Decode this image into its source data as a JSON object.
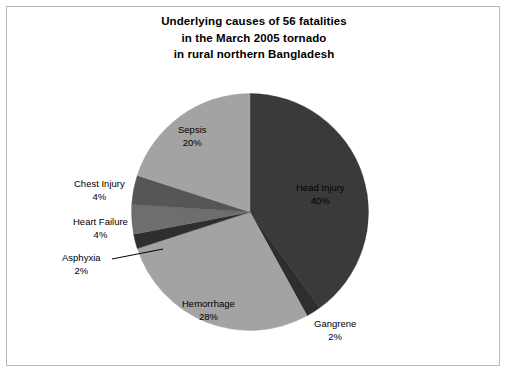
{
  "chart_data": {
    "type": "pie",
    "title": "Underlying causes of 56 fatalities in the March 2005 tornado in rural northern Bangladesh",
    "title_lines": [
      "Underlying causes of 56 fatalities",
      "in the March 2005 tornado",
      "in rural northern Bangladesh"
    ],
    "total_fatalities": 56,
    "legend": "none",
    "labels_inline": true,
    "start_angle_deg": 0,
    "direction": "clockwise",
    "categories": [
      "Head Injury",
      "Gangrene",
      "Hemorrhage",
      "Asphyxia",
      "Heart Failure",
      "Chest Injury",
      "Sepsis"
    ],
    "values": [
      40,
      2,
      28,
      2,
      4,
      4,
      20
    ],
    "value_unit": "percent",
    "slices": [
      {
        "name": "Head Injury",
        "percent": 40,
        "percent_text": "40%",
        "color": "#3a3a3a"
      },
      {
        "name": "Gangrene",
        "percent": 2,
        "percent_text": "2%",
        "color": "#2e2e2e"
      },
      {
        "name": "Hemorrhage",
        "percent": 28,
        "percent_text": "28%",
        "color": "#a3a3a3"
      },
      {
        "name": "Asphyxia",
        "percent": 2,
        "percent_text": "2%",
        "color": "#2e2e2e"
      },
      {
        "name": "Heart Failure",
        "percent": 4,
        "percent_text": "4%",
        "color": "#6e6e6e"
      },
      {
        "name": "Chest Injury",
        "percent": 4,
        "percent_text": "4%",
        "color": "#565656"
      },
      {
        "name": "Sepsis",
        "percent": 20,
        "percent_text": "20%",
        "color": "#a3a3a3"
      }
    ],
    "xlabel": "",
    "ylabel": ""
  },
  "frame": {
    "border_color": "#b9b9b9",
    "background": "#ffffff"
  }
}
